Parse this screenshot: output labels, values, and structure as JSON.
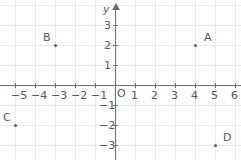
{
  "chart_data": {
    "type": "scatter",
    "title": "",
    "xlabel": "x",
    "ylabel": "y",
    "origin_label": "O",
    "grid": true,
    "legend": "none",
    "xlim": [
      -5.75,
      6.3
    ],
    "ylim": [
      -3.75,
      3.75
    ],
    "x_ticks": [
      -5,
      -4,
      -3,
      -2,
      -1,
      1,
      2,
      3,
      4,
      5,
      6
    ],
    "y_ticks": [
      -3,
      -2,
      -1,
      1,
      2,
      3
    ],
    "x_tick_labels": [
      "−5",
      "−4",
      "−3",
      "−2",
      "−1",
      "1",
      "2",
      "3",
      "4",
      "5",
      "6"
    ],
    "y_tick_labels": [
      "−3",
      "−2",
      "−1",
      "1",
      "2",
      "3"
    ],
    "points": [
      {
        "label": "A",
        "x": 4,
        "y": 2,
        "label_dx": 9,
        "label_dy": -13
      },
      {
        "label": "B",
        "x": -3,
        "y": 2,
        "label_dx": -12,
        "label_dy": -13
      },
      {
        "label": "C",
        "x": -5,
        "y": -2,
        "label_dx": -12,
        "label_dy": -13
      },
      {
        "label": "D",
        "x": 5,
        "y": -3,
        "label_dx": 8,
        "label_dy": -13
      }
    ]
  },
  "style": {
    "grid_color": "#e9e9ec",
    "axis_color": "#6e6e72",
    "text_color": "#58585c",
    "point_color": "#5c5c60",
    "background": "#ffffff"
  },
  "geometry": {
    "origin_x": 115,
    "origin_y": 85,
    "unit": 20,
    "width": 241,
    "height": 160
  }
}
